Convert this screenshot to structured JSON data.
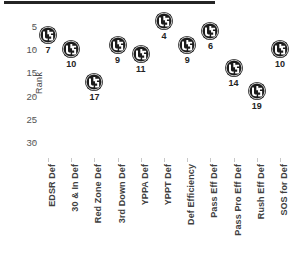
{
  "chart_data": {
    "type": "scatter",
    "title": "",
    "xlabel": "",
    "ylabel": "Rank",
    "ylim": [
      33,
      3
    ],
    "y_inverted": true,
    "grid": false,
    "legend": "none",
    "y_ticks": [
      5,
      10,
      15,
      20,
      25,
      30
    ],
    "marker_icon": "team-logo-circle",
    "categories": [
      "EDSR Def",
      "30 & In Def",
      "Red Zone Def",
      "3rd Down Def",
      "YPPA Def",
      "YPPT Def",
      "Def Efficiency",
      "Pass Eff Def",
      "Pass Pro Eff Def",
      "Rush Eff Def",
      "SOS for Def"
    ],
    "values": [
      7,
      10,
      17,
      9,
      11,
      4,
      9,
      6,
      14,
      19,
      10
    ],
    "point_labels": [
      "7",
      "10",
      "17",
      "9",
      "11",
      "4",
      "9",
      "6",
      "14",
      "19",
      "10"
    ]
  },
  "colors": {
    "marker_fill": "#1b1b1b",
    "marker_glyph": "#ffffff",
    "axis_text": "#4a4a4a",
    "rule": "#242424",
    "background": "#ffffff"
  },
  "decor": {
    "top_rule_name": "top-divider-rule"
  }
}
